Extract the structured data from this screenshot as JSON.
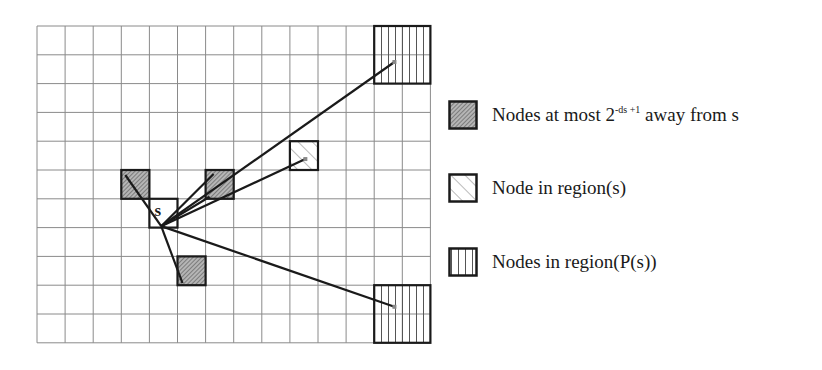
{
  "grid": {
    "left": 37,
    "top": 26,
    "cols": 14,
    "rows": 11,
    "col_width": 28.1,
    "row_height": 28.8,
    "line_color": "#8a8a8a"
  },
  "source_node": {
    "label": "s",
    "col": 4,
    "row": 6
  },
  "nodes_near": [
    {
      "col": 3,
      "row": 5
    },
    {
      "col": 6,
      "row": 5
    },
    {
      "col": 5,
      "row": 8
    }
  ],
  "node_region_s": {
    "col": 9,
    "row": 4
  },
  "nodes_region_ps": [
    {
      "col": 12,
      "row": 0,
      "size": 2
    },
    {
      "col": 12,
      "row": 9,
      "size": 2
    }
  ],
  "legend": {
    "items": [
      {
        "id": "near",
        "label_prefix": "Nodes at most 2",
        "label_sup": "-ds +1",
        "label_suffix": " away from s"
      },
      {
        "id": "region-s",
        "label": "Node in region(s)"
      },
      {
        "id": "region-ps",
        "label": "Nodes in region(P(s))"
      }
    ]
  },
  "colors": {
    "stroke": "#1a1a1a",
    "hatch_fill": "#9a9a9a",
    "grid": "#8a8a8a"
  }
}
